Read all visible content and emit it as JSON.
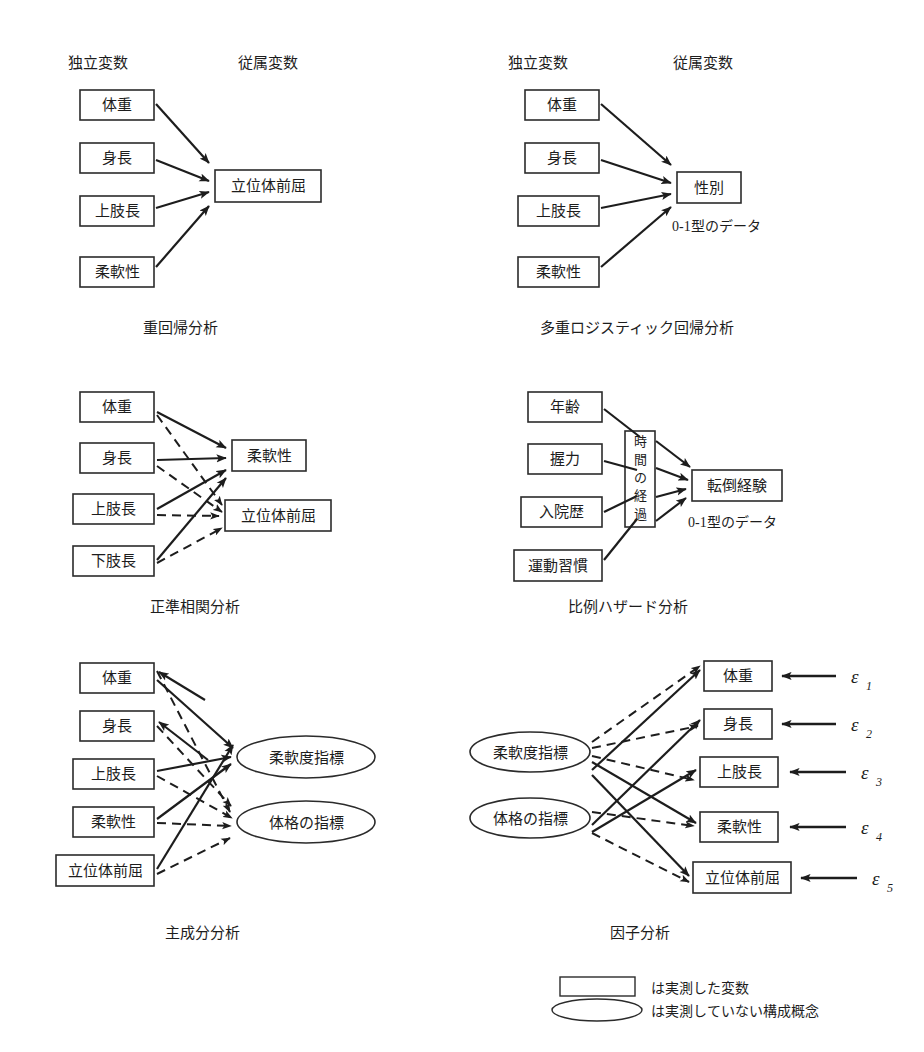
{
  "figure": {
    "title_present": false,
    "panels": [
      {
        "id": "multiple-regression",
        "caption": "重回帰分析",
        "col_headers": {
          "left": "独立変数",
          "right": "従属変数"
        },
        "independent": [
          "体重",
          "身長",
          "上肢長",
          "柔軟性"
        ],
        "dependent": [
          "立位体前屈"
        ],
        "note": "",
        "arrow_styles": [
          "solid",
          "solid",
          "solid",
          "solid"
        ]
      },
      {
        "id": "multiple-logistic-regression",
        "caption": "多重ロジスティック回帰分析",
        "col_headers": {
          "left": "独立変数",
          "right": "従属変数"
        },
        "independent": [
          "体重",
          "身長",
          "上肢長",
          "柔軟性"
        ],
        "dependent": [
          "性別"
        ],
        "note": "0-1型のデータ",
        "arrow_styles": [
          "solid",
          "solid",
          "solid",
          "solid"
        ]
      },
      {
        "id": "canonical-correlation",
        "caption": "正準相関分析",
        "col_headers": {
          "left": "",
          "right": ""
        },
        "independent": [
          "体重",
          "身長",
          "上肢長",
          "下肢長"
        ],
        "dependent": [
          "柔軟性",
          "立位体前屈"
        ],
        "note": "",
        "arrow_styles": [
          "solid",
          "dashed"
        ]
      },
      {
        "id": "proportional-hazards",
        "caption": "比例ハザード分析",
        "col_headers": {
          "left": "",
          "right": ""
        },
        "independent": [
          "年齢",
          "握力",
          "入院歴",
          "運動習慣"
        ],
        "mediator": "時間の経過",
        "mediator_chars": [
          "時",
          "間",
          "の",
          "経",
          "過"
        ],
        "dependent": [
          "転倒経験"
        ],
        "note": "0-1型のデータ",
        "arrow_styles": [
          "solid"
        ]
      },
      {
        "id": "principal-component-analysis",
        "caption": "主成分分析",
        "col_headers": {
          "left": "",
          "right": ""
        },
        "observed": [
          "体重",
          "身長",
          "上肢長",
          "柔軟性",
          "立位体前屈"
        ],
        "constructs": [
          "柔軟度指標",
          "体格の指標"
        ],
        "note": "",
        "arrow_styles": [
          "solid",
          "dashed"
        ]
      },
      {
        "id": "factor-analysis",
        "caption": "因子分析",
        "col_headers": {
          "left": "",
          "right": ""
        },
        "constructs": [
          "柔軟度指標",
          "体格の指標"
        ],
        "observed": [
          "体重",
          "身長",
          "上肢長",
          "柔軟性",
          "立位体前屈"
        ],
        "errors": [
          {
            "symbol": "ε",
            "sub": "1"
          },
          {
            "symbol": "ε",
            "sub": "2"
          },
          {
            "symbol": "ε",
            "sub": "3"
          },
          {
            "symbol": "ε",
            "sub": "4"
          },
          {
            "symbol": "ε",
            "sub": "5"
          }
        ],
        "note": "",
        "arrow_styles": [
          "solid",
          "dashed"
        ]
      }
    ],
    "legend": {
      "items": [
        {
          "shape": "rectangle",
          "label": "は実測した変数"
        },
        {
          "shape": "ellipse",
          "label": "は実測していない構成概念"
        }
      ]
    },
    "colors": {
      "stroke": "#2b2b2b",
      "text": "#1d1d1d",
      "background": "#ffffff"
    }
  }
}
